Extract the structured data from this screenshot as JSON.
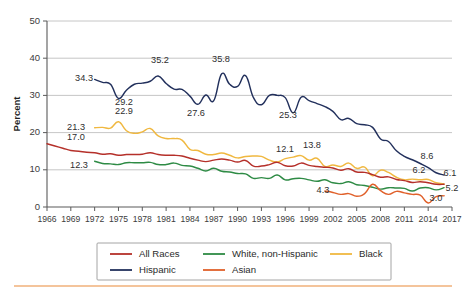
{
  "chart_data": {
    "type": "line",
    "title": "",
    "xlabel": "",
    "ylabel": "Percent",
    "xlim": [
      1966,
      2017
    ],
    "ylim": [
      0,
      50
    ],
    "ytick_step": 10,
    "xtick_step": 3,
    "grid": true,
    "legend_position": "bottom",
    "yticks": [
      "0",
      "10",
      "20",
      "30",
      "40",
      "50"
    ],
    "xticks": [
      "1966",
      "1969",
      "1972",
      "1975",
      "1978",
      "1981",
      "1984",
      "1987",
      "1990",
      "1993",
      "1996",
      "1999",
      "2002",
      "2005",
      "2008",
      "2011",
      "2014",
      "2017"
    ],
    "series": [
      {
        "name": "All Races",
        "color": "#b5302a",
        "x": [
          1966,
          1967,
          1968,
          1969,
          1970,
          1971,
          1972,
          1973,
          1974,
          1975,
          1976,
          1977,
          1978,
          1979,
          1980,
          1981,
          1982,
          1983,
          1984,
          1985,
          1986,
          1987,
          1988,
          1989,
          1990,
          1991,
          1992,
          1993,
          1994,
          1995,
          1996,
          1997,
          1998,
          1999,
          2000,
          2001,
          2002,
          2003,
          2004,
          2005,
          2006,
          2007,
          2008,
          2009,
          2010,
          2011,
          2012,
          2013,
          2014,
          2015,
          2016
        ],
        "values": [
          17.0,
          16.4,
          15.8,
          15.2,
          15.0,
          14.7,
          14.6,
          14.2,
          14.3,
          13.9,
          14.1,
          14.1,
          14.2,
          14.6,
          14.1,
          13.9,
          13.9,
          13.7,
          13.1,
          12.6,
          12.2,
          12.6,
          12.9,
          12.6,
          12.1,
          12.5,
          11.0,
          11.0,
          11.4,
          12.0,
          11.1,
          11.0,
          11.8,
          11.2,
          10.9,
          10.7,
          10.5,
          9.9,
          10.3,
          9.4,
          9.3,
          8.7,
          8.0,
          8.1,
          7.4,
          7.1,
          6.6,
          6.8,
          6.5,
          6.1,
          6.1
        ],
        "end_label": "6.1",
        "start_label": "17.0"
      },
      {
        "name": "Hispanic",
        "color": "#22305c",
        "x": [
          1972,
          1973,
          1974,
          1975,
          1976,
          1977,
          1978,
          1979,
          1980,
          1981,
          1982,
          1983,
          1984,
          1985,
          1986,
          1987,
          1988,
          1989,
          1990,
          1991,
          1992,
          1993,
          1994,
          1995,
          1996,
          1997,
          1998,
          1999,
          2000,
          2001,
          2002,
          2003,
          2004,
          2005,
          2006,
          2007,
          2008,
          2009,
          2010,
          2011,
          2012,
          2013,
          2014,
          2015,
          2016
        ],
        "values": [
          34.3,
          33.5,
          33.0,
          29.2,
          31.4,
          33.0,
          33.3,
          33.8,
          35.2,
          33.2,
          31.7,
          31.6,
          29.8,
          27.6,
          30.1,
          28.6,
          35.8,
          33.0,
          32.4,
          35.3,
          29.4,
          27.5,
          30.0,
          30.0,
          29.4,
          25.3,
          29.5,
          28.6,
          27.8,
          27.0,
          25.7,
          23.5,
          23.8,
          22.4,
          22.1,
          21.4,
          18.3,
          17.6,
          15.1,
          13.6,
          12.7,
          11.7,
          10.6,
          9.2,
          8.6
        ],
        "start_label": "34.3",
        "end_label": "8.6",
        "annotations": [
          {
            "text": "34.3",
            "year": 1972,
            "value": 34.3
          },
          {
            "text": "29.2",
            "year": 1975,
            "value": 29.2
          },
          {
            "text": "35.2",
            "year": 1980,
            "value": 35.2
          },
          {
            "text": "27.6",
            "year": 1985,
            "value": 27.6
          },
          {
            "text": "35.8",
            "year": 1988,
            "value": 35.8
          },
          {
            "text": "25.3",
            "year": 1997,
            "value": 25.3
          },
          {
            "text": "8.6",
            "year": 2016,
            "value": 8.6
          }
        ]
      },
      {
        "name": "White, non-Hispanic",
        "color": "#2e8b45",
        "x": [
          1972,
          1973,
          1974,
          1975,
          1976,
          1977,
          1978,
          1979,
          1980,
          1981,
          1982,
          1983,
          1984,
          1985,
          1986,
          1987,
          1988,
          1989,
          1990,
          1991,
          1992,
          1993,
          1994,
          1995,
          1996,
          1997,
          1998,
          1999,
          2000,
          2001,
          2002,
          2003,
          2004,
          2005,
          2006,
          2007,
          2008,
          2009,
          2010,
          2011,
          2012,
          2013,
          2014,
          2015,
          2016
        ],
        "values": [
          12.3,
          11.7,
          11.6,
          11.4,
          11.9,
          11.9,
          11.9,
          12.0,
          11.4,
          11.4,
          11.8,
          11.2,
          11.0,
          10.4,
          9.7,
          10.4,
          9.6,
          9.4,
          9.0,
          8.9,
          7.7,
          7.9,
          7.7,
          8.6,
          7.3,
          7.6,
          7.7,
          7.3,
          6.9,
          7.3,
          6.5,
          6.3,
          6.8,
          6.0,
          5.8,
          5.3,
          4.8,
          5.2,
          5.1,
          5.0,
          4.3,
          5.1,
          5.2,
          4.6,
          5.2
        ],
        "start_label": "12.3",
        "end_label": "5.2"
      },
      {
        "name": "Asian",
        "color": "#e0602a",
        "x": [
          2001,
          2002,
          2003,
          2004,
          2005,
          2006,
          2007,
          2008,
          2009,
          2010,
          2011,
          2012,
          2013,
          2014,
          2015,
          2016
        ],
        "values": [
          4.3,
          3.9,
          3.4,
          3.6,
          2.9,
          3.6,
          6.1,
          4.4,
          3.4,
          4.2,
          3.8,
          3.4,
          3.2,
          1.1,
          2.8,
          3.0
        ],
        "start_label": "4.3",
        "end_label": "3.0"
      },
      {
        "name": "Black",
        "color": "#f0b840",
        "x": [
          1972,
          1973,
          1974,
          1975,
          1976,
          1977,
          1978,
          1979,
          1980,
          1981,
          1982,
          1983,
          1984,
          1985,
          1986,
          1987,
          1988,
          1989,
          1990,
          1991,
          1992,
          1993,
          1994,
          1995,
          1996,
          1997,
          1998,
          1999,
          2000,
          2001,
          2002,
          2003,
          2004,
          2005,
          2006,
          2007,
          2008,
          2009,
          2010,
          2011,
          2012,
          2013,
          2014,
          2015,
          2016
        ],
        "values": [
          21.3,
          21.4,
          21.2,
          22.9,
          20.5,
          19.8,
          20.2,
          21.1,
          19.1,
          18.4,
          18.4,
          18.0,
          15.5,
          15.2,
          14.2,
          14.1,
          14.5,
          13.9,
          13.2,
          13.6,
          13.7,
          13.6,
          12.6,
          12.1,
          13.0,
          13.4,
          13.8,
          12.6,
          13.1,
          10.9,
          11.3,
          10.9,
          11.8,
          10.4,
          10.7,
          8.4,
          9.9,
          9.3,
          8.0,
          7.3,
          7.5,
          7.3,
          7.4,
          6.5,
          6.2
        ],
        "start_label": "21.3",
        "end_label": "6.2",
        "annotations": [
          {
            "text": "21.3",
            "year": 1972,
            "value": 21.3
          },
          {
            "text": "22.9",
            "year": 1975,
            "value": 22.9
          },
          {
            "text": "12.1",
            "year": 1995,
            "value": 12.1
          },
          {
            "text": "13.8",
            "year": 1998,
            "value": 13.8
          },
          {
            "text": "6.2",
            "year": 2016,
            "value": 6.2
          }
        ]
      }
    ],
    "data_labels": [
      {
        "text": "34.3",
        "x": 93,
        "y": 81,
        "anchor": "end"
      },
      {
        "text": "29.2",
        "x": 124,
        "y": 105,
        "anchor": "middle"
      },
      {
        "text": "22.9",
        "x": 124,
        "y": 114,
        "anchor": "middle"
      },
      {
        "text": "35.2",
        "x": 160,
        "y": 63,
        "anchor": "middle"
      },
      {
        "text": "27.6",
        "x": 196,
        "y": 116,
        "anchor": "middle"
      },
      {
        "text": "35.8",
        "x": 221,
        "y": 62,
        "anchor": "middle"
      },
      {
        "text": "25.3",
        "x": 288,
        "y": 118,
        "anchor": "middle"
      },
      {
        "text": "8.6",
        "x": 427,
        "y": 159,
        "anchor": "middle"
      },
      {
        "text": "21.3",
        "x": 85,
        "y": 130,
        "anchor": "end"
      },
      {
        "text": "17.0",
        "x": 67,
        "y": 140,
        "anchor": "start"
      },
      {
        "text": "12.3",
        "x": 79,
        "y": 168,
        "anchor": "middle"
      },
      {
        "text": "12.1",
        "x": 285,
        "y": 152,
        "anchor": "middle"
      },
      {
        "text": "13.8",
        "x": 312,
        "y": 148,
        "anchor": "middle"
      },
      {
        "text": "6.2",
        "x": 419,
        "y": 173,
        "anchor": "middle"
      },
      {
        "text": "6.1",
        "x": 450,
        "y": 176,
        "anchor": "middle"
      },
      {
        "text": "5.2",
        "x": 452,
        "y": 191,
        "anchor": "middle"
      },
      {
        "text": "4.3",
        "x": 323,
        "y": 193,
        "anchor": "middle"
      },
      {
        "text": "3.0",
        "x": 436,
        "y": 201,
        "anchor": "middle"
      }
    ]
  },
  "legend": {
    "entries": [
      {
        "label": "All Races",
        "color": "#b5302a"
      },
      {
        "label": "White, non-Hispanic",
        "color": "#2e8b45"
      },
      {
        "label": "Black",
        "color": "#f0b840"
      },
      {
        "label": "Hispanic",
        "color": "#22305c"
      },
      {
        "label": "Asian",
        "color": "#e0602a"
      }
    ]
  },
  "footer": {
    "rule_color": "#f0b07a"
  }
}
